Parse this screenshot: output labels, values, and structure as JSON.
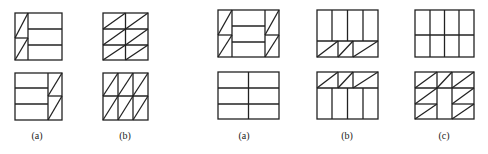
{
  "labels": {
    "left_a": "(a)",
    "left_b": "(b)",
    "right_a": "(a)",
    "right_b": "(b)",
    "right_c": "(c)"
  },
  "colors": {
    "stroke": "#222222",
    "background": "#ffffff"
  },
  "figures": {
    "left_group": [
      {
        "id": "left-a",
        "description": "Square grid: left column split into 2 with diagonals, right portion 3 horizontal strips; bottom variant mirrored"
      },
      {
        "id": "left-b",
        "description": "Square 2x3 grid with diagonals (top), 3x2 grid with diagonals (bottom)"
      }
    ],
    "right_group": [
      {
        "id": "right-a",
        "description": "Rectangle: triangulated side columns with 3-strip center (top); 2x3 plain grid (bottom)"
      },
      {
        "id": "right-b",
        "description": "Rectangle: 4 vertical strips above triangulated row (top); triangulated row above 4 vertical strips (bottom)"
      },
      {
        "id": "right-c",
        "description": "Rectangle: 4x2 plain grid (top); 3-column grid with triangulated cells and empty center-lower (bottom)"
      }
    ]
  }
}
